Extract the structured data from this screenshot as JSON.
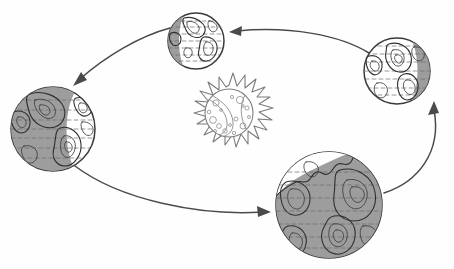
{
  "diagram": {
    "kind": "astronomy-orbit-illustration",
    "style": "hand-drawn pencil sketch",
    "canvas": {
      "width": 454,
      "height": 269,
      "background": "#fefefe"
    },
    "palette": {
      "background": "#fefefe",
      "ink": "#3b3b3b",
      "shadow_gray": "#9d9d9d",
      "lit_white": "#ffffff",
      "arrow": "#4a4a4a",
      "sun_ink": "#8a8a8a"
    },
    "sun": {
      "label": "Sun",
      "center_x": 229,
      "center_y": 113,
      "core_radius": 24,
      "ray_count": 18,
      "ray_length": 12,
      "spot_count": 16,
      "has_swirl_band": true
    },
    "orbit": {
      "label": "Earth's orbital path",
      "direction": "counter-clockwise",
      "arrow_count": 4
    },
    "earths": [
      {
        "name": "earth-top",
        "position": "top",
        "center_x": 196,
        "center_y": 41,
        "radius": 28,
        "shadow_side": "left",
        "shadow_fraction": 0.22,
        "lit_fraction": 0.78
      },
      {
        "name": "earth-left",
        "position": "left",
        "center_x": 53,
        "center_y": 129,
        "radius": 42,
        "shadow_side": "left",
        "shadow_fraction": 0.72,
        "lit_fraction": 0.28
      },
      {
        "name": "earth-bottom",
        "position": "bottom",
        "center_x": 329,
        "center_y": 205,
        "radius": 53,
        "shadow_side": "full-except-top-left",
        "shadow_fraction": 0.88,
        "lit_fraction": 0.12
      },
      {
        "name": "earth-right",
        "position": "right",
        "center_x": 397,
        "center_y": 71,
        "radius": 33,
        "shadow_side": "right",
        "shadow_fraction": 0.25,
        "lit_fraction": 0.75
      }
    ],
    "arrows": [
      {
        "name": "arrow-right-to-top",
        "from": "earth-right",
        "to": "earth-top",
        "head_x": 231,
        "head_y": 32,
        "head_direction": "left"
      },
      {
        "name": "arrow-top-to-left",
        "from": "earth-top",
        "to": "earth-left",
        "head_x": 74,
        "head_y": 84,
        "head_direction": "down-left"
      },
      {
        "name": "arrow-left-to-bottom",
        "from": "earth-left",
        "to": "earth-bottom",
        "head_x": 270,
        "head_y": 212,
        "head_direction": "right"
      },
      {
        "name": "arrow-bottom-to-right",
        "from": "earth-bottom",
        "to": "earth-right",
        "head_x": 435,
        "head_y": 101,
        "head_direction": "up-left"
      }
    ]
  }
}
